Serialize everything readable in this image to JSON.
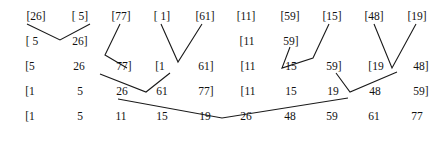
{
  "diagram": {
    "type": "merge-sort-trace",
    "background_color": "#ffffff",
    "text_color": "#111111",
    "line_color": "#1a1a1a",
    "rows": [
      {
        "level": 1,
        "cells": [
          {
            "text": "[26]",
            "x": 36
          },
          {
            "text": "[ 5]",
            "x": 80
          },
          {
            "text": "[77]",
            "x": 121
          },
          {
            "text": "[ 1]",
            "x": 162
          },
          {
            "text": "[61]",
            "x": 205
          },
          {
            "text": "[11]",
            "x": 246
          },
          {
            "text": "[59]",
            "x": 290
          },
          {
            "text": "[15]",
            "x": 332
          },
          {
            "text": "[48]",
            "x": 374
          },
          {
            "text": "[19]",
            "x": 417
          }
        ]
      },
      {
        "level": 2,
        "cells": [
          {
            "text": "[ 5",
            "x": 32
          },
          {
            "text": "26]",
            "x": 80
          },
          {
            "text": "[11",
            "x": 247
          },
          {
            "text": "59]",
            "x": 291
          }
        ]
      },
      {
        "level": 3,
        "cells": [
          {
            "text": "[5",
            "x": 30
          },
          {
            "text": "26",
            "x": 79
          },
          {
            "text": "77]",
            "x": 124
          },
          {
            "text": "[1",
            "x": 160
          },
          {
            "text": "61]",
            "x": 206
          },
          {
            "text": "[11",
            "x": 248
          },
          {
            "text": "15",
            "x": 291
          },
          {
            "text": "59]",
            "x": 334
          },
          {
            "text": "[19",
            "x": 376
          },
          {
            "text": "48]",
            "x": 421
          }
        ]
      },
      {
        "level": 4,
        "cells": [
          {
            "text": "[1",
            "x": 30
          },
          {
            "text": "5",
            "x": 80
          },
          {
            "text": "26",
            "x": 122
          },
          {
            "text": "61",
            "x": 162
          },
          {
            "text": "77]",
            "x": 206
          },
          {
            "text": "[11",
            "x": 248
          },
          {
            "text": "15",
            "x": 291
          },
          {
            "text": "19",
            "x": 333
          },
          {
            "text": "48",
            "x": 375
          },
          {
            "text": "59]",
            "x": 421
          }
        ]
      },
      {
        "level": 5,
        "cells": [
          {
            "text": "[1",
            "x": 30
          },
          {
            "text": "5",
            "x": 80
          },
          {
            "text": "11",
            "x": 121
          },
          {
            "text": "15",
            "x": 162
          },
          {
            "text": "19",
            "x": 205
          },
          {
            "text": "26",
            "x": 246
          },
          {
            "text": "48",
            "x": 290
          },
          {
            "text": "59",
            "x": 332
          },
          {
            "text": "61",
            "x": 374
          },
          {
            "text": "77",
            "x": 417
          }
        ]
      }
    ],
    "connectors": [
      {
        "name": "merge-26-5",
        "points": "27,24 60,40 90,24"
      },
      {
        "name": "merge-77-down",
        "points": "120,24 105,55 127,68"
      },
      {
        "name": "merge-1-61",
        "points": "161,24 178,62 202,24"
      },
      {
        "name": "merge-59-down",
        "points": "290,47 282,68 313,58 329,24"
      },
      {
        "name": "merge-48-19",
        "points": "374,24 392,68 416,24"
      },
      {
        "name": "merge-level3-left",
        "points": "100,74 146,92 170,73"
      },
      {
        "name": "merge-level3-right",
        "points": "336,73 350,92 397,72"
      },
      {
        "name": "merge-final",
        "points": "118,99 222,118 348,98"
      }
    ]
  }
}
